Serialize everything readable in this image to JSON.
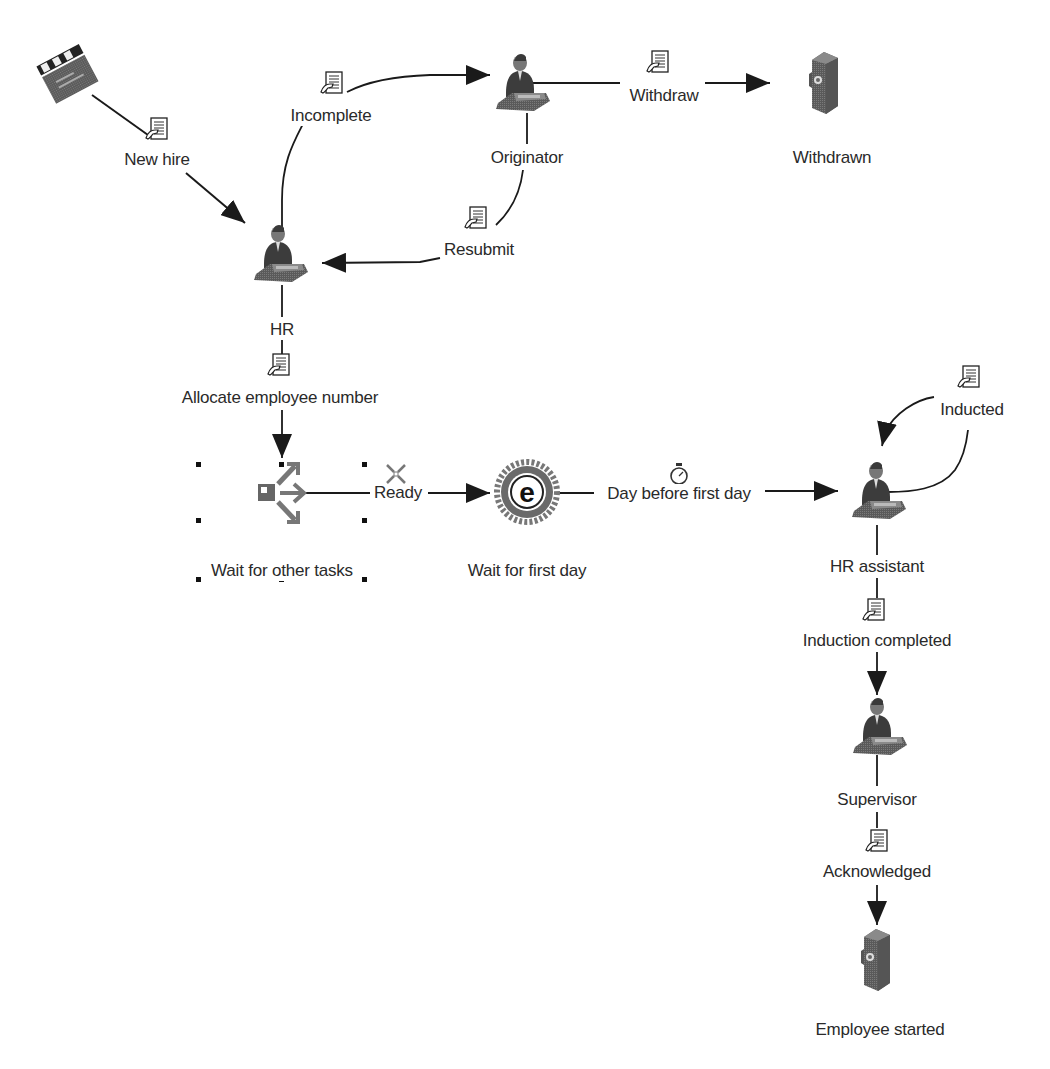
{
  "diagram": {
    "nodes": {
      "start": {
        "label": "",
        "icon": "clapperboard-icon"
      },
      "originator": {
        "label": "Originator",
        "icon": "person-at-desk-icon"
      },
      "withdrawn": {
        "label": "Withdrawn",
        "icon": "end-safe-icon"
      },
      "hr": {
        "label": "HR",
        "icon": "person-at-desk-icon"
      },
      "wait_other": {
        "label": "Wait for other tasks",
        "icon": "split-join-icon"
      },
      "wait_first_day": {
        "label": "Wait for first day",
        "icon": "event-gear-icon"
      },
      "hr_assistant": {
        "label": "HR assistant",
        "icon": "person-at-desk-icon"
      },
      "supervisor": {
        "label": "Supervisor",
        "icon": "person-at-desk-icon"
      },
      "employee_started": {
        "label": "Employee started",
        "icon": "end-safe-icon"
      }
    },
    "transitions": {
      "new_hire": {
        "label": "New hire",
        "icon": "document-icon"
      },
      "incomplete": {
        "label": "Incomplete",
        "icon": "document-icon"
      },
      "withdraw": {
        "label": "Withdraw",
        "icon": "document-icon"
      },
      "resubmit": {
        "label": "Resubmit",
        "icon": "document-icon"
      },
      "allocate": {
        "label": "Allocate employee number",
        "icon": "document-icon"
      },
      "ready": {
        "label": "Ready",
        "icon": "merge-arrows-icon"
      },
      "day_before": {
        "label": "Day before first day",
        "icon": "stopwatch-icon"
      },
      "inducted": {
        "label": "Inducted",
        "icon": "document-icon"
      },
      "induction_completed": {
        "label": "Induction completed",
        "icon": "document-icon"
      },
      "acknowledged": {
        "label": "Acknowledged",
        "icon": "document-icon"
      }
    },
    "colors": {
      "line": "#1a1a1a",
      "icon_gray": "#6b6b6b",
      "text": "#2a2a2a"
    }
  }
}
